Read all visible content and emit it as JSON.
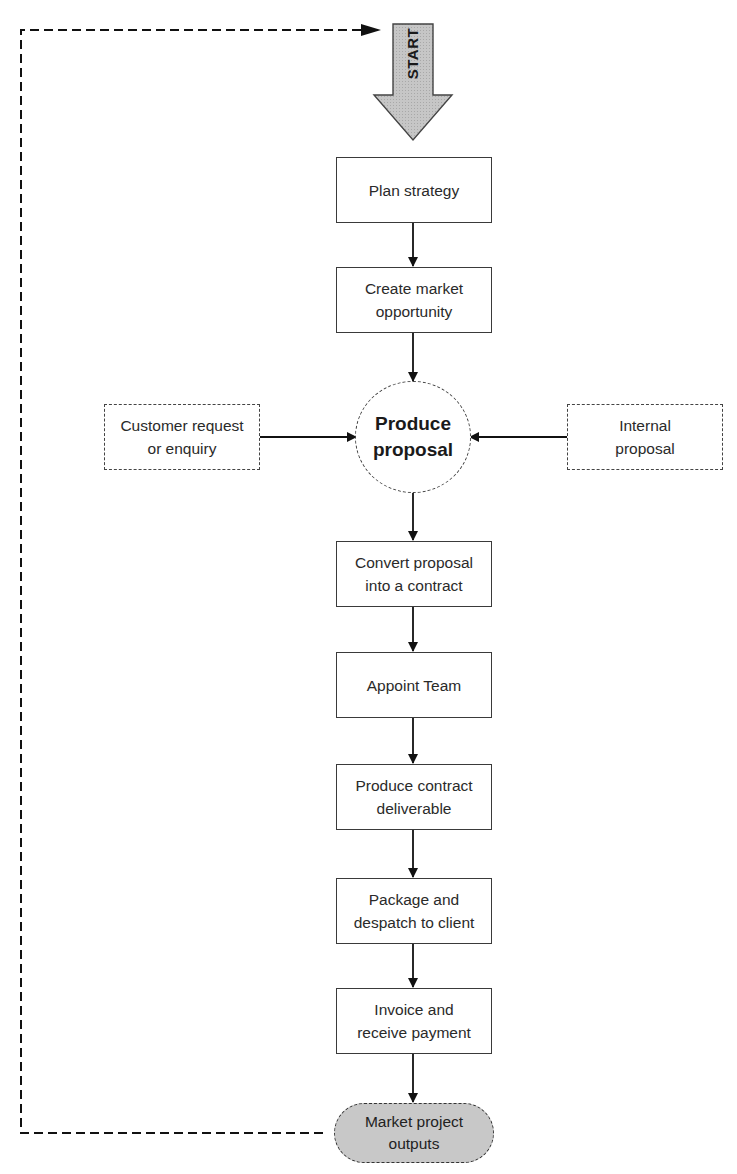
{
  "start": {
    "label": "START",
    "fill": "#c4c4c4"
  },
  "steps": [
    {
      "id": "plan",
      "label": "Plan strategy"
    },
    {
      "id": "market",
      "label": "Create market\nopportunity"
    },
    {
      "id": "convert",
      "label": "Convert proposal\ninto a contract"
    },
    {
      "id": "appoint",
      "label": "Appoint Team"
    },
    {
      "id": "deliverable",
      "label": "Produce contract\ndeliverable"
    },
    {
      "id": "package",
      "label": "Package and\ndespatch to client"
    },
    {
      "id": "invoice",
      "label": "Invoice and\nreceive payment"
    }
  ],
  "hub": {
    "label": "Produce\nproposal"
  },
  "inputs": {
    "left": {
      "label": "Customer request\nor enquiry"
    },
    "right": {
      "label": "Internal\nproposal"
    }
  },
  "end": {
    "label": "Market project\noutputs",
    "fill": "#c8c8c8"
  },
  "feedback_loop": {
    "style": "dashed",
    "from": "Market project outputs",
    "to": "START"
  }
}
